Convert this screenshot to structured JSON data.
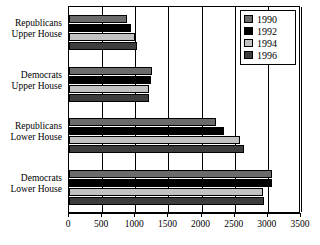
{
  "chart_data": {
    "type": "bar",
    "orientation": "horizontal",
    "title": "",
    "xlabel": "",
    "ylabel": "",
    "xlim": [
      0,
      3500
    ],
    "xticks": [
      0,
      500,
      1000,
      1500,
      2000,
      2500,
      3000,
      3500
    ],
    "xtick_labels": [
      "0",
      "500",
      "1000",
      "1500",
      "2000",
      "2500",
      "3000",
      "3500"
    ],
    "grid": true,
    "legend_position": "top-right",
    "categories": [
      "Republicans Upper House",
      "Democrats Upper House",
      "Republicans Lower House",
      "Democrats Lower House"
    ],
    "category_lines": [
      [
        "Republicans",
        "Upper House"
      ],
      [
        "Democrats",
        "Upper House"
      ],
      [
        "Republicans",
        "Lower House"
      ],
      [
        "Democrats",
        "Lower House"
      ]
    ],
    "series": [
      {
        "name": "1990",
        "color": "#6b6b6b",
        "values": [
          870,
          1255,
          2215,
          3070
        ]
      },
      {
        "name": "1992",
        "color": "#000000",
        "values": [
          935,
          1230,
          2345,
          3070
        ]
      },
      {
        "name": "1994",
        "color": "#c2c2c2",
        "values": [
          1000,
          1200,
          2585,
          2925
        ]
      },
      {
        "name": "1996",
        "color": "#3d3d3d",
        "values": [
          1030,
          1200,
          2640,
          2940
        ]
      }
    ]
  },
  "legend": {
    "entries": [
      {
        "label": "1990",
        "color": "#6b6b6b"
      },
      {
        "label": "1992",
        "color": "#000000"
      },
      {
        "label": "1994",
        "color": "#c2c2c2"
      },
      {
        "label": "1996",
        "color": "#3d3d3d"
      }
    ]
  },
  "colors": {
    "axis": "#000000",
    "grid": "#000000",
    "background": "#ffffff",
    "series_1990": "#6b6b6b",
    "series_1992": "#000000",
    "series_1994": "#c2c2c2",
    "series_1996": "#3d3d3d"
  }
}
